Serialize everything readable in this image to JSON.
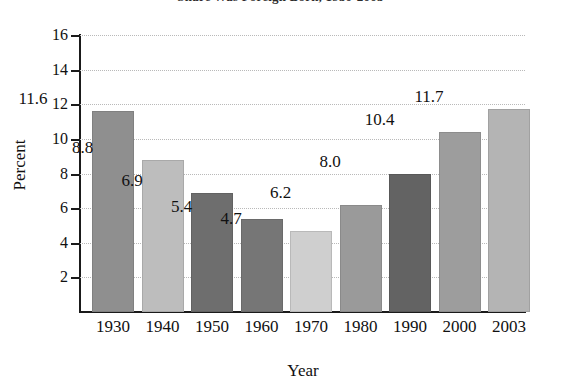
{
  "chart_data": {
    "type": "bar",
    "title": "Share Was Foreign Born, 1930-2003",
    "xlabel": "Year",
    "ylabel": "Percent",
    "categories": [
      "1930",
      "1940",
      "1950",
      "1960",
      "1970",
      "1980",
      "1990",
      "2000",
      "2003"
    ],
    "values": [
      11.6,
      8.8,
      6.9,
      5.4,
      4.7,
      6.2,
      8.0,
      10.4,
      11.7
    ],
    "value_labels": [
      "11.6",
      "8.8",
      "6.9",
      "5.4",
      "4.7",
      "6.2",
      "8.0",
      "10.4",
      "11.7"
    ],
    "bar_colors": [
      "#8f8f8f",
      "#bdbdbd",
      "#6e6e6e",
      "#767676",
      "#cfcfcf",
      "#9a9a9a",
      "#636363",
      "#9d9d9d",
      "#b4b4b4"
    ],
    "ylim": [
      0,
      16
    ],
    "ytick_labels": [
      "2",
      "4",
      "6",
      "8",
      "10",
      "12",
      "14",
      "16"
    ],
    "ytick_values": [
      2,
      4,
      6,
      8,
      10,
      12,
      14,
      16
    ],
    "grid": "horizontal-dotted",
    "legend": "none"
  }
}
